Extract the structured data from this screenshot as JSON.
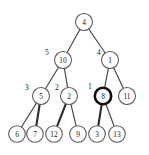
{
  "figure": {
    "background_color": "#ffffff",
    "node_fill": "#ffffff",
    "node_stroke": "#5a5a5a",
    "highlight_stroke": "#0d0d0d",
    "edge_color": "#4a4a4a",
    "text_color": "#1a1a1a"
  },
  "chart_data": {
    "type": "diagram",
    "title": "",
    "nodes": [
      {
        "id": "n4",
        "label": "4",
        "x": 84,
        "y": 22,
        "r": 8.5,
        "highlighted": false
      },
      {
        "id": "n10",
        "label": "10",
        "x": 63,
        "y": 60,
        "r": 8.5,
        "highlighted": false
      },
      {
        "id": "n1",
        "label": "1",
        "x": 110,
        "y": 60,
        "r": 8.5,
        "highlighted": false
      },
      {
        "id": "n5",
        "label": "5",
        "x": 41,
        "y": 96,
        "r": 8.5,
        "highlighted": false
      },
      {
        "id": "n2",
        "label": "2",
        "x": 69,
        "y": 96,
        "r": 8.5,
        "highlighted": false
      },
      {
        "id": "n8",
        "label": "8",
        "x": 103,
        "y": 96,
        "r": 8.2,
        "highlighted": true
      },
      {
        "id": "n11",
        "label": "11",
        "x": 127,
        "y": 96,
        "r": 8.5,
        "highlighted": false
      },
      {
        "id": "n6",
        "label": "6",
        "x": 17,
        "y": 134,
        "r": 8.3,
        "highlighted": false
      },
      {
        "id": "n7",
        "label": "7",
        "x": 35,
        "y": 134,
        "r": 8.3,
        "highlighted": false
      },
      {
        "id": "n12",
        "label": "12",
        "x": 54,
        "y": 134,
        "r": 8.3,
        "highlighted": false
      },
      {
        "id": "n9",
        "label": "9",
        "x": 78,
        "y": 134,
        "r": 8.3,
        "highlighted": false
      },
      {
        "id": "n3",
        "label": "3",
        "x": 97,
        "y": 134,
        "r": 8.3,
        "highlighted": false
      },
      {
        "id": "n13",
        "label": "13",
        "x": 117,
        "y": 134,
        "r": 8.3,
        "highlighted": false
      }
    ],
    "edges": [
      {
        "from": "n4",
        "to": "n10",
        "thick": false
      },
      {
        "from": "n4",
        "to": "n1",
        "thick": false
      },
      {
        "from": "n10",
        "to": "n5",
        "thick": false
      },
      {
        "from": "n10",
        "to": "n2",
        "thick": false
      },
      {
        "from": "n1",
        "to": "n8",
        "thick": false
      },
      {
        "from": "n1",
        "to": "n11",
        "thick": false
      },
      {
        "from": "n5",
        "to": "n6",
        "thick": false
      },
      {
        "from": "n5",
        "to": "n7",
        "thick": true
      },
      {
        "from": "n2",
        "to": "n12",
        "thick": true
      },
      {
        "from": "n2",
        "to": "n9",
        "thick": false
      },
      {
        "from": "n8",
        "to": "n3",
        "thick": true
      },
      {
        "from": "n8",
        "to": "n13",
        "thick": false
      }
    ],
    "edge_labels": [
      {
        "id": "lbl-5",
        "text": "5",
        "x": 47,
        "y": 52,
        "for_node": "n10"
      },
      {
        "id": "lbl-4",
        "text": "4",
        "x": 99,
        "y": 52,
        "for_node": "n1"
      },
      {
        "id": "lbl-3",
        "text": "3",
        "x": 27,
        "y": 87,
        "for_node": "n5"
      },
      {
        "id": "lbl-2",
        "text": "2",
        "x": 57,
        "y": 87,
        "for_node": "n2"
      },
      {
        "id": "lbl-1",
        "text": "1",
        "x": 90,
        "y": 86,
        "for_node": "n8"
      }
    ],
    "node_labels": [
      "4",
      "10",
      "1",
      "5",
      "2",
      "8",
      "11",
      "6",
      "7",
      "12",
      "9",
      "3",
      "13"
    ],
    "highlighted_node": "8",
    "xlim": [
      0,
      149
    ],
    "ylim": [
      0,
      155
    ]
  }
}
